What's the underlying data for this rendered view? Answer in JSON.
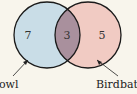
{
  "diagram": {
    "type": "venn",
    "sets": [
      {
        "label": "Bowl",
        "visible_label": "owl",
        "only_count": "7",
        "color": "#c9dde7"
      },
      {
        "label": "Birdbath",
        "visible_label": "Birdbat",
        "only_count": "5",
        "color": "#f1cbc3"
      }
    ],
    "intersection": {
      "count": "3",
      "color": "#a9909d"
    },
    "background": "#f8f5ec"
  }
}
